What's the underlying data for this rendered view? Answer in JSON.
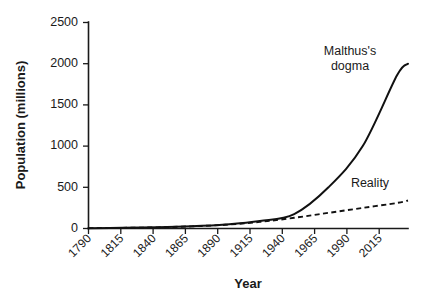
{
  "chart_data": {
    "type": "line",
    "title": "",
    "xlabel": "Year",
    "ylabel": "Population (millions)",
    "xlim": [
      1790,
      2023
    ],
    "ylim": [
      0,
      2500
    ],
    "grid": false,
    "legend_position": "inline-annotation",
    "x_tick_labels": [
      "1790",
      "1815",
      "1840",
      "1865",
      "1890",
      "1915",
      "1940",
      "1965",
      "1990",
      "2015"
    ],
    "x_ticks": [
      1790,
      1815,
      1840,
      1865,
      1890,
      1915,
      1940,
      1965,
      1990,
      2015
    ],
    "y_tick_labels": [
      "0",
      "500",
      "1000",
      "1500",
      "2000",
      "2500"
    ],
    "y_ticks": [
      0,
      500,
      1000,
      1500,
      2000,
      2500
    ],
    "x": [
      1790,
      1815,
      1840,
      1865,
      1890,
      1915,
      1940,
      1965,
      1990,
      2015,
      2023
    ],
    "series": [
      {
        "name": "Malthus's dogma",
        "style": "solid",
        "values": [
          4,
          8,
          14,
          26,
          48,
          90,
          175,
          500,
          1000,
          1860,
          2000
        ]
      },
      {
        "name": "Reality",
        "style": "dashed",
        "values": [
          4,
          8,
          14,
          26,
          45,
          80,
          130,
          190,
          250,
          310,
          340
        ]
      }
    ],
    "annotations": [
      {
        "text": "Malthus's dogma",
        "lines": [
          "Malthus's",
          "dogma"
        ],
        "x": 1975,
        "y": 2280
      },
      {
        "text": "Reality",
        "lines": [
          "Reality"
        ],
        "x": 1988,
        "y": 640
      }
    ]
  },
  "axes": {
    "x_title": "Year",
    "y_title": "Population (millions)"
  }
}
